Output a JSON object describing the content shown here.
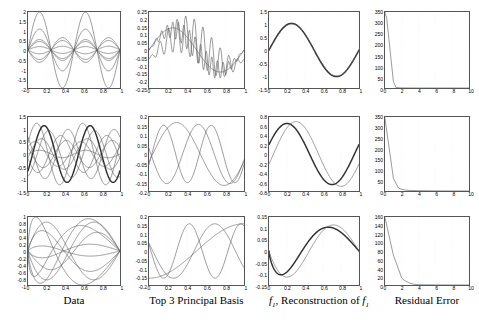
{
  "figure": {
    "rows": 3,
    "cols": 4,
    "background": "#ffffff",
    "axis_color": "#555555",
    "line_color": "#606060",
    "bold_line_color": "#303030",
    "column_labels": [
      "Data",
      "Top 3 Principal Basis",
      "f1, Reconstruction of f1",
      "Residual Error"
    ]
  },
  "chart_data": [
    {
      "id": "r1c1",
      "type": "line",
      "title": "",
      "xlabel": "",
      "ylabel": "",
      "xlim": [
        0,
        1
      ],
      "ylim": [
        -2,
        2
      ],
      "xticks": [
        0,
        0.2,
        0.4,
        0.6,
        0.8,
        1
      ],
      "xticklabels": [
        "0",
        "0.2",
        "0.4",
        "0.6",
        "0.8",
        "1"
      ],
      "yticks": [
        -2,
        -1.5,
        -1,
        -0.5,
        0,
        0.5,
        1,
        1.5,
        2
      ],
      "yticklabels": [
        "-2",
        "-1.5",
        "-1",
        "-0.5",
        "0",
        "0.5",
        "1",
        "1.5",
        "2"
      ],
      "grid": true,
      "legend": "none",
      "series": [
        {
          "name": "f1",
          "form": "sine",
          "amplitude": 2.0,
          "cycles": 2,
          "phase": 0
        },
        {
          "name": "f2",
          "form": "sine",
          "amplitude": 1.1,
          "cycles": 2,
          "phase": 0
        },
        {
          "name": "f3",
          "form": "sine",
          "amplitude": 0.55,
          "cycles": 2,
          "phase": 0
        },
        {
          "name": "f4",
          "form": "sine",
          "amplitude": 0.45,
          "cycles": 2,
          "phase": 0
        },
        {
          "name": "f5",
          "form": "sine",
          "amplitude": -0.5,
          "cycles": 2,
          "phase": 0
        },
        {
          "name": "f6",
          "form": "sine",
          "amplitude": -0.65,
          "cycles": 2,
          "phase": 0
        },
        {
          "name": "f7",
          "form": "sine",
          "amplitude": 0.18,
          "cycles": 2,
          "phase": 0
        },
        {
          "name": "f8",
          "form": "sine",
          "amplitude": -0.2,
          "cycles": 2,
          "phase": 0
        }
      ]
    },
    {
      "id": "r1c2",
      "type": "line",
      "xlim": [
        0,
        1
      ],
      "ylim": [
        -0.25,
        0.25
      ],
      "xticks": [
        0,
        0.2,
        0.4,
        0.6,
        0.8,
        1
      ],
      "xticklabels": [
        "0",
        "0.2",
        "0.4",
        "0.6",
        "0.8",
        "1"
      ],
      "yticks": [
        -0.25,
        -0.2,
        -0.15,
        -0.1,
        -0.05,
        0,
        0.05,
        0.1,
        0.15,
        0.2,
        0.25
      ],
      "yticklabels": [
        "-0.25",
        "-0.2",
        "-0.15",
        "-0.1",
        "-0.05",
        "0",
        "0.05",
        "0.1",
        "0.15",
        "0.2",
        "0.25"
      ],
      "grid": true,
      "series": [
        {
          "name": "pc1",
          "form": "sine",
          "amplitude": 0.145,
          "cycles": 1,
          "phase": 0
        },
        {
          "name": "pc2",
          "form": "sine_noisy",
          "amplitude": 0.13,
          "cycles": 1,
          "phase": 0,
          "noise_amp": 0.075,
          "noise_cycles": 17
        },
        {
          "name": "pc3",
          "form": "sine_noisy",
          "amplitude": 0.1,
          "cycles": 1,
          "phase": 0.1,
          "noise_amp": 0.135,
          "noise_cycles": 11
        }
      ]
    },
    {
      "id": "r1c3",
      "type": "line",
      "xlim": [
        0,
        1
      ],
      "ylim": [
        -1.5,
        1.5
      ],
      "xticks": [
        0,
        0.2,
        0.4,
        0.6,
        0.8,
        1
      ],
      "xticklabels": [
        "0",
        "0.2",
        "0.4",
        "0.6",
        "0.8",
        "1"
      ],
      "yticks": [
        -1.5,
        -1,
        -0.5,
        0,
        0.5,
        1,
        1.5
      ],
      "yticklabels": [
        "-1.5",
        "-1",
        "-0.5",
        "0",
        "0.5",
        "1",
        "1.5"
      ],
      "grid": true,
      "series": [
        {
          "name": "f1",
          "form": "sine",
          "amplitude": 1.05,
          "cycles": 1,
          "phase": 0,
          "bold": true
        },
        {
          "name": "reconstruction",
          "form": "sine",
          "amplitude": 1.03,
          "cycles": 1,
          "phase": 0.005
        }
      ]
    },
    {
      "id": "r1c4",
      "type": "line",
      "xlim": [
        0,
        10
      ],
      "ylim": [
        0,
        350
      ],
      "xticks": [
        0,
        2,
        4,
        6,
        8,
        10
      ],
      "xticklabels": [
        "0",
        "2",
        "4",
        "6",
        "8",
        "10"
      ],
      "yticks": [
        0,
        50,
        100,
        150,
        200,
        250,
        300,
        350
      ],
      "yticklabels": [
        "0",
        "50",
        "100",
        "150",
        "200",
        "250",
        "300",
        "350"
      ],
      "grid": true,
      "series": [
        {
          "name": "residual",
          "x": [
            0,
            0.2,
            1,
            1.3,
            2,
            3,
            4,
            6,
            8,
            10
          ],
          "y": [
            348,
            322,
            30,
            2,
            0.6,
            0.3,
            0.2,
            0.1,
            0.05,
            0
          ]
        }
      ]
    },
    {
      "id": "r2c1",
      "type": "line",
      "xlim": [
        0,
        1
      ],
      "ylim": [
        -1.5,
        1.5
      ],
      "xticks": [
        0,
        0.2,
        0.4,
        0.6,
        0.8,
        1
      ],
      "xticklabels": [
        "0",
        "0.2",
        "0.4",
        "0.6",
        "0.8",
        "1"
      ],
      "yticks": [
        -1.5,
        -1,
        -0.5,
        0,
        0.5,
        1,
        1.5
      ],
      "yticklabels": [
        "-1.5",
        "-1",
        "-0.5",
        "0",
        "0.5",
        "1",
        "1.5"
      ],
      "grid": true,
      "series": [
        {
          "name": "g1",
          "form": "sine",
          "amplitude": 1.25,
          "cycles": 2,
          "phase": -0.03
        },
        {
          "name": "g2",
          "form": "sine",
          "amplitude": 1.15,
          "cycles": 2,
          "phase": 0.05,
          "bold": true
        },
        {
          "name": "g3",
          "form": "sine",
          "amplitude": 0.95,
          "cycles": 2,
          "phase": 0.1
        },
        {
          "name": "g4",
          "form": "sine",
          "amplitude": 0.62,
          "cycles": 2,
          "phase": 0.02
        },
        {
          "name": "g5",
          "form": "sine",
          "amplitude": 0.5,
          "cycles": 2,
          "phase": -0.05
        },
        {
          "name": "g6",
          "form": "sine",
          "amplitude": -0.55,
          "cycles": 2,
          "phase": 0.04
        },
        {
          "name": "g7",
          "form": "sine",
          "amplitude": -0.75,
          "cycles": 2,
          "phase": -0.02
        },
        {
          "name": "g8",
          "form": "sine",
          "amplitude": -1.0,
          "cycles": 2,
          "phase": 0.06
        },
        {
          "name": "g9",
          "form": "sine",
          "amplitude": 0.15,
          "cycles": 2,
          "phase": 0
        }
      ]
    },
    {
      "id": "r2c2",
      "type": "line",
      "xlim": [
        0,
        1
      ],
      "ylim": [
        -0.2,
        0.2
      ],
      "xticks": [
        0,
        0.2,
        0.4,
        0.6,
        0.8,
        1
      ],
      "xticklabels": [
        "0",
        "0.2",
        "0.4",
        "0.6",
        "0.8",
        "1"
      ],
      "yticks": [
        -0.2,
        -0.15,
        -0.1,
        -0.05,
        0,
        0.05,
        0.1,
        0.15,
        0.2
      ],
      "yticklabels": [
        "-0.2",
        "-0.15",
        "-0.1",
        "-0.05",
        "0",
        "0.05",
        "0.1",
        "0.15",
        "0.2"
      ],
      "grid": true,
      "series": [
        {
          "name": "pc1",
          "form": "sine",
          "amplitude": 0.17,
          "cycles": 1,
          "phase": 0.04
        },
        {
          "name": "pc2",
          "form": "sine",
          "amplitude": -0.16,
          "cycles": 1.5,
          "phase": 0.02
        },
        {
          "name": "pc3",
          "form": "sine",
          "amplitude": 0.155,
          "cycles": 2,
          "phase": 0.03
        }
      ]
    },
    {
      "id": "r2c3",
      "type": "line",
      "xlim": [
        0,
        1
      ],
      "ylim": [
        -0.8,
        0.8
      ],
      "xticks": [
        0,
        0.2,
        0.4,
        0.6,
        0.8,
        1
      ],
      "xticklabels": [
        "0",
        "0.2",
        "0.4",
        "0.6",
        "0.8",
        "1"
      ],
      "yticks": [
        -0.8,
        -0.6,
        -0.4,
        -0.2,
        0,
        0.2,
        0.4,
        0.6,
        0.8
      ],
      "yticklabels": [
        "-0.8",
        "-0.6",
        "-0.4",
        "-0.2",
        "0",
        "0.2",
        "0.4",
        "0.6",
        "0.8"
      ],
      "grid": true,
      "series": [
        {
          "name": "f1",
          "form": "sine",
          "amplitude": 0.66,
          "cycles": 1,
          "phase": -0.05,
          "bold": true
        },
        {
          "name": "reconstruction",
          "form": "sine",
          "amplitude": 0.7,
          "cycles": 1,
          "phase": 0.05
        }
      ]
    },
    {
      "id": "r2c4",
      "type": "line",
      "xlim": [
        0,
        10
      ],
      "ylim": [
        0,
        350
      ],
      "xticks": [
        0,
        2,
        4,
        6,
        8,
        10
      ],
      "xticklabels": [
        "0",
        "2",
        "4",
        "6",
        "8",
        "10"
      ],
      "yticks": [
        0,
        50,
        100,
        150,
        200,
        250,
        300,
        350
      ],
      "yticklabels": [
        "0",
        "50",
        "100",
        "150",
        "200",
        "250",
        "300",
        "350"
      ],
      "grid": true,
      "series": [
        {
          "name": "residual",
          "x": [
            0,
            0.15,
            1,
            1.6,
            2,
            2.5,
            3,
            4,
            6,
            8,
            10
          ],
          "y": [
            345,
            300,
            60,
            14,
            8,
            4,
            2.5,
            1.5,
            0.8,
            0.4,
            0.2
          ]
        }
      ]
    },
    {
      "id": "r3c1",
      "type": "line",
      "xlim": [
        0,
        1
      ],
      "ylim": [
        -1,
        1
      ],
      "xticks": [
        0,
        0.2,
        0.4,
        0.6,
        0.8,
        1
      ],
      "xticklabels": [
        "0",
        "0.2",
        "0.4",
        "0.6",
        "0.8",
        "1"
      ],
      "yticks": [
        -1,
        -0.8,
        -0.6,
        -0.4,
        -0.2,
        0,
        0.2,
        0.4,
        0.6,
        0.8,
        1
      ],
      "yticklabels": [
        "-1",
        "-0.8",
        "-0.6",
        "-0.4",
        "-0.2",
        "0",
        "0.2",
        "0.4",
        "0.6",
        "0.8",
        "1"
      ],
      "grid": true,
      "series": [
        {
          "name": "h1",
          "form": "skewed",
          "amplitude": 0.95,
          "shift": 0.62
        },
        {
          "name": "h2",
          "form": "skewed",
          "amplitude": 0.85,
          "shift": 0.55
        },
        {
          "name": "h3",
          "form": "skewed",
          "amplitude": 0.75,
          "shift": 0.7
        },
        {
          "name": "h4",
          "form": "skewed",
          "amplitude": 0.55,
          "shift": 0.5
        },
        {
          "name": "h5",
          "form": "skewed",
          "amplitude": -0.6,
          "shift": 0.6
        },
        {
          "name": "h6",
          "form": "skewed",
          "amplitude": -0.85,
          "shift": 0.55
        },
        {
          "name": "h7",
          "form": "skewed",
          "amplitude": -1.0,
          "shift": 0.68
        },
        {
          "name": "h8",
          "form": "skewed",
          "amplitude": 0.2,
          "shift": 0.6
        },
        {
          "name": "h9",
          "form": "skewed",
          "amplitude": -0.15,
          "shift": 0.6
        }
      ]
    },
    {
      "id": "r3c2",
      "type": "line",
      "xlim": [
        0,
        1
      ],
      "ylim": [
        -0.2,
        0.2
      ],
      "xticks": [
        0,
        0.2,
        0.4,
        0.6,
        0.8,
        1
      ],
      "xticklabels": [
        "0",
        "0.2",
        "0.4",
        "0.6",
        "0.8",
        "1"
      ],
      "yticks": [
        -0.2,
        -0.15,
        -0.1,
        -0.05,
        0,
        0.05,
        0.1,
        0.15,
        0.2
      ],
      "yticklabels": [
        "-0.2",
        "-0.15",
        "-0.1",
        "-0.05",
        "0",
        "0.05",
        "0.1",
        "0.15",
        "0.2"
      ],
      "grid": true,
      "series": [
        {
          "name": "pc1",
          "form": "monotone",
          "amplitude": 0.16
        },
        {
          "name": "pc2",
          "form": "sine",
          "amplitude": -0.16,
          "cycles": 1.15,
          "phase": 0.04
        },
        {
          "name": "pc3",
          "form": "sine",
          "amplitude": -0.16,
          "cycles": 1.85,
          "phase": 0.02
        }
      ]
    },
    {
      "id": "r3c3",
      "type": "line",
      "xlim": [
        0,
        1
      ],
      "ylim": [
        -0.15,
        0.15
      ],
      "xticks": [
        0,
        0.2,
        0.4,
        0.6,
        0.8,
        1
      ],
      "xticklabels": [
        "0",
        "0.2",
        "0.4",
        "0.6",
        "0.8",
        "1"
      ],
      "yticks": [
        -0.15,
        -0.1,
        -0.05,
        0,
        0.05,
        0.1,
        0.15
      ],
      "yticklabels": [
        "-0.15",
        "-0.1",
        "-0.05",
        "0",
        "0.05",
        "0.1",
        "0.15"
      ],
      "grid": true,
      "series": [
        {
          "name": "f1",
          "form": "skewed",
          "amplitude": 0.105,
          "shift": 0.62,
          "bold": true
        },
        {
          "name": "reconstruction",
          "form": "skewed",
          "amplitude": 0.115,
          "shift": 0.55
        }
      ]
    },
    {
      "id": "r3c4",
      "type": "line",
      "xlim": [
        0,
        10
      ],
      "ylim": [
        0,
        160
      ],
      "xticks": [
        0,
        2,
        4,
        6,
        8,
        10
      ],
      "xticklabels": [
        "0",
        "2",
        "4",
        "6",
        "8",
        "10"
      ],
      "yticks": [
        0,
        20,
        40,
        60,
        80,
        100,
        120,
        140,
        160
      ],
      "yticklabels": [
        "0",
        "20",
        "40",
        "60",
        "80",
        "100",
        "120",
        "140",
        "160"
      ],
      "grid": true,
      "series": [
        {
          "name": "residual",
          "x": [
            0,
            0.1,
            1,
            2,
            2.3,
            3,
            3.6,
            4,
            5,
            6,
            8,
            10
          ],
          "y": [
            158,
            150,
            70,
            16,
            11,
            4,
            1.2,
            0.8,
            0.4,
            0.25,
            0.12,
            0.05
          ]
        }
      ]
    }
  ]
}
